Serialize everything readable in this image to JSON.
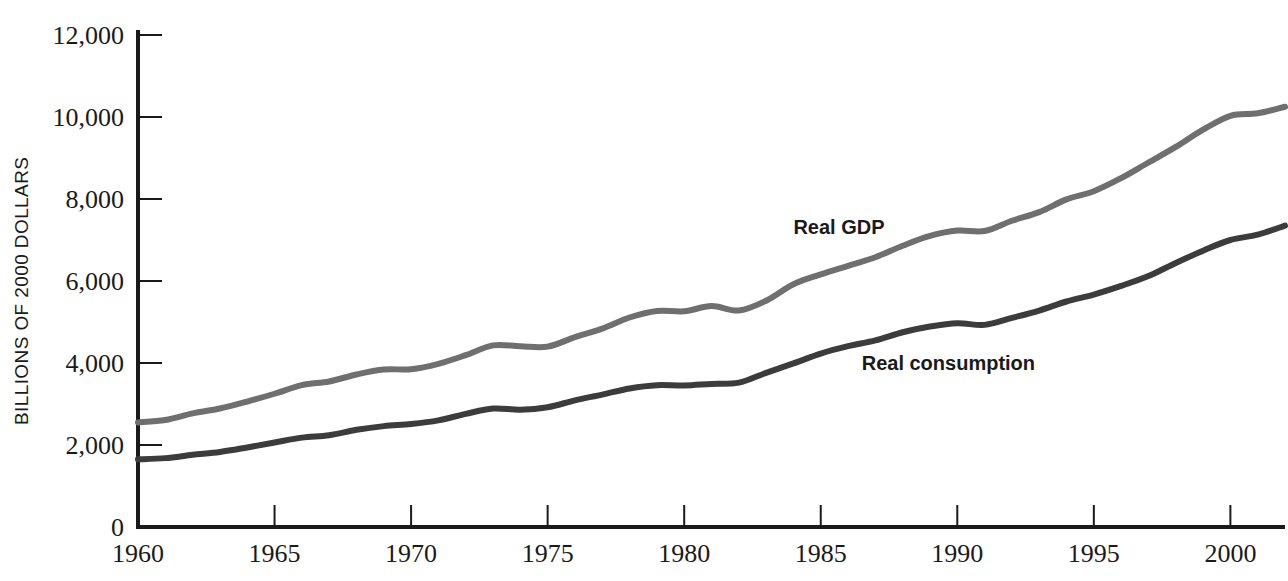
{
  "chart_data": {
    "type": "line",
    "title": "",
    "subtitle": "",
    "xlabel": "",
    "ylabel": "BILLIONS OF 2000 DOLLARS",
    "xlim": [
      1960,
      2002
    ],
    "ylim": [
      0,
      12000
    ],
    "grid": false,
    "legend_position": "inline-annotation",
    "x_ticks": [
      1960,
      1965,
      1970,
      1975,
      1980,
      1985,
      1990,
      1995,
      2000
    ],
    "x_tick_labels": [
      "1960",
      "1965",
      "1970",
      "1975",
      "1980",
      "1985",
      "1990",
      "1995",
      "2000"
    ],
    "y_ticks": [
      0,
      2000,
      4000,
      6000,
      8000,
      10000,
      12000
    ],
    "y_tick_labels": [
      "0",
      "2,000",
      "4,000",
      "6,000",
      "8,000",
      "10,000",
      "12,000"
    ],
    "x": [
      1960,
      1961,
      1962,
      1963,
      1964,
      1965,
      1966,
      1967,
      1968,
      1969,
      1970,
      1971,
      1972,
      1973,
      1974,
      1975,
      1976,
      1977,
      1978,
      1979,
      1980,
      1981,
      1982,
      1983,
      1984,
      1985,
      1986,
      1987,
      1988,
      1989,
      1990,
      1991,
      1992,
      1993,
      1994,
      1995,
      1996,
      1997,
      1998,
      1999,
      2000,
      2001,
      2002
    ],
    "series": [
      {
        "name": "Real GDP",
        "color": "#6f6f6f",
        "label_x": 1984.0,
        "label_y": 7150,
        "values": [
          2550,
          2610,
          2770,
          2890,
          3060,
          3250,
          3460,
          3550,
          3720,
          3840,
          3850,
          3980,
          4190,
          4430,
          4410,
          4400,
          4630,
          4840,
          5110,
          5270,
          5260,
          5390,
          5280,
          5520,
          5920,
          6160,
          6370,
          6580,
          6860,
          7100,
          7230,
          7220,
          7470,
          7680,
          7990,
          8190,
          8510,
          8890,
          9270,
          9690,
          10030,
          10090,
          10250
        ]
      },
      {
        "name": "Real consumption",
        "color": "#3c3c3c",
        "label_x": 1986.5,
        "label_y": 3830,
        "values": [
          1650,
          1680,
          1760,
          1830,
          1940,
          2060,
          2180,
          2240,
          2370,
          2460,
          2510,
          2600,
          2760,
          2890,
          2860,
          2920,
          3090,
          3230,
          3380,
          3460,
          3450,
          3490,
          3520,
          3760,
          3990,
          4230,
          4410,
          4550,
          4750,
          4890,
          4970,
          4930,
          5100,
          5280,
          5500,
          5670,
          5880,
          6120,
          6440,
          6740,
          7000,
          7130,
          7350
        ]
      }
    ]
  },
  "axes": {
    "y_axis_label_text": "BILLIONS OF 2000 DOLLARS",
    "origin_label": "0"
  }
}
